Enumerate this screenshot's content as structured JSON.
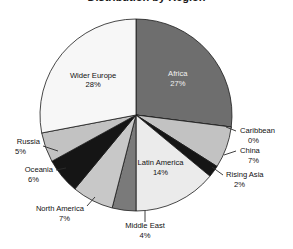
{
  "chart_data": {
    "type": "pie",
    "title": "Distribution by Region",
    "title_clipped": true,
    "subtitle": "",
    "xlabel": "",
    "ylabel": "",
    "legend_position": "none",
    "grid": false,
    "value_unit": "%",
    "categories": [
      "Africa",
      "Caribbean",
      "China",
      "Rising Asia",
      "Latin America",
      "Middle East",
      "North America",
      "Oceania",
      "Russia",
      "Wider Europe"
    ],
    "values": [
      27,
      0,
      7,
      2,
      14,
      4,
      7,
      6,
      5,
      28
    ],
    "slices": [
      {
        "name": "Africa",
        "label": "Africa",
        "percent": 27,
        "percent_text": "27%",
        "color": "#6e6e6e",
        "label_placement": "inside",
        "label_color": "#f2f2f2"
      },
      {
        "name": "Caribbean",
        "label": "Caribbean",
        "percent": 0,
        "percent_text": "0%",
        "color": "#3a3a3a",
        "label_placement": "outside",
        "label_color": "#111111"
      },
      {
        "name": "China",
        "label": "China",
        "percent": 7,
        "percent_text": "7%",
        "color": "#c2c2c2",
        "label_placement": "outside",
        "label_color": "#111111"
      },
      {
        "name": "Rising Asia",
        "label": "Rising Asia",
        "percent": 2,
        "percent_text": "2%",
        "color": "#151515",
        "label_placement": "outside",
        "label_color": "#111111"
      },
      {
        "name": "Latin America",
        "label": "Latin America",
        "percent": 14,
        "percent_text": "14%",
        "color": "#ebebeb",
        "label_placement": "inside",
        "label_color": "#111111"
      },
      {
        "name": "Middle East",
        "label": "Middle East",
        "percent": 4,
        "percent_text": "4%",
        "color": "#7a7a7a",
        "label_placement": "outside",
        "label_color": "#111111"
      },
      {
        "name": "North America",
        "label": "North America",
        "percent": 7,
        "percent_text": "7%",
        "color": "#c8c8c8",
        "label_placement": "outside",
        "label_color": "#111111"
      },
      {
        "name": "Oceania",
        "label": "Oceania",
        "percent": 6,
        "percent_text": "6%",
        "color": "#151515",
        "label_placement": "outside",
        "label_color": "#111111"
      },
      {
        "name": "Russia",
        "label": "Russia",
        "percent": 5,
        "percent_text": "5%",
        "color": "#c2c2c2",
        "label_placement": "outside",
        "label_color": "#111111"
      },
      {
        "name": "Wider Europe",
        "label": "Wider Europe",
        "percent": 28,
        "percent_text": "28%",
        "color": "#f7f7f7",
        "label_placement": "inside",
        "label_color": "#111111"
      }
    ],
    "geometry": {
      "center_x": 136,
      "center_y": 115,
      "radius": 96,
      "start_angle_deg": 0,
      "direction": "clockwise"
    },
    "colors": {
      "background": "#ffffff",
      "outline": "#1a1a1a",
      "text": "#111111",
      "inverse_text": "#f2f2f2"
    }
  }
}
